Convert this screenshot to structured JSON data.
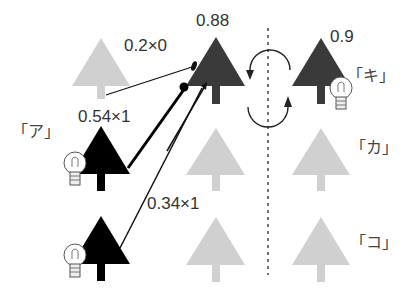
{
  "diagram": {
    "title": "",
    "weights": {
      "top_input": "0.2×0",
      "middle_input": "0.54×1",
      "bottom_input": "0.34×1"
    },
    "outputs": {
      "left_top_value": "0.88",
      "right_top_value": "0.9"
    },
    "labels": {
      "left_middle": "「ア」",
      "right_top": "「キ」",
      "right_middle": "「カ」",
      "right_bottom": "「コ」"
    },
    "colors": {
      "active_tree": "#000000",
      "dark_tree": "#3a3a3a",
      "inactive_tree": "#d0d0d0",
      "line": "#111111"
    }
  }
}
